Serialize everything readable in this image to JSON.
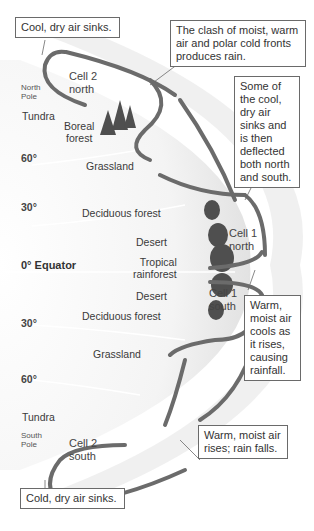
{
  "callouts": {
    "cool_dry_sinks": "Cool, dry air sinks.",
    "clash": "The clash of moist, warm air and polar cold fronts produces rain.",
    "deflected": "Some of the cool, dry air sinks and is then deflected both north and south.",
    "warm_moist_cools": "Warm, moist air cools as it rises, causing rainfall.",
    "warm_moist_rises": "Warm, moist air rises; rain falls.",
    "cold_dry_sinks": "Cold, dry air sinks."
  },
  "cells": {
    "cell2_north": [
      "Cell 2",
      "north"
    ],
    "cell1_north": [
      "Cell 1",
      "north"
    ],
    "cell1_south": [
      "Cell 1",
      "south"
    ],
    "cell2_south": [
      "Cell 2",
      "south"
    ]
  },
  "poles": {
    "north": [
      "North",
      "Pole"
    ],
    "south": [
      "South",
      "Pole"
    ]
  },
  "latitudes": {
    "n60": "60°",
    "n30": "30°",
    "equator": "0° Equator",
    "s30": "30°",
    "s60": "60°"
  },
  "biomes": {
    "tundra_north": "Tundra",
    "boreal": [
      "Boreal",
      "forest"
    ],
    "grassland_north": "Grassland",
    "deciduous_north": "Deciduous forest",
    "desert_north": "Desert",
    "tropical": [
      "Tropical",
      "rainforest"
    ],
    "desert_south": "Desert",
    "deciduous_south": "Deciduous forest",
    "grassland_south": "Grassland",
    "tundra_south": "Tundra"
  },
  "colors": {
    "arrow": "#6b6b6b",
    "band": "#e4e4e4",
    "earth": "#f2f2f2",
    "forest": "#555555"
  }
}
